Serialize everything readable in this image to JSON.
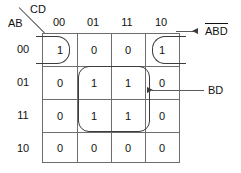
{
  "diagram": {
    "type": "karnaugh-map",
    "variables": {
      "columns_var": "CD",
      "rows_var": "AB"
    },
    "column_headers": [
      "00",
      "01",
      "11",
      "10"
    ],
    "row_headers": [
      "00",
      "01",
      "11",
      "10"
    ],
    "cells": [
      [
        "1",
        "0",
        "0",
        "1"
      ],
      [
        "0",
        "1",
        "1",
        "0"
      ],
      [
        "0",
        "1",
        "1",
        "0"
      ],
      [
        "0",
        "0",
        "0",
        "0"
      ]
    ],
    "annotations": [
      {
        "id": "corner-term",
        "text_plain": "ABD",
        "parts": [
          {
            "text": "A",
            "overbar": true
          },
          {
            "text": "B",
            "overbar": true
          },
          {
            "text": "D",
            "overbar": true
          }
        ],
        "arrow": "left"
      },
      {
        "id": "center-term",
        "text_plain": "BD",
        "parts": [
          {
            "text": "BD",
            "overbar": false
          }
        ],
        "arrow": "left"
      }
    ],
    "colors": {
      "grid_line": "#6d6d6d",
      "group_outline": "#3c3c3c",
      "text": "#111111",
      "background": "#ffffff"
    }
  }
}
